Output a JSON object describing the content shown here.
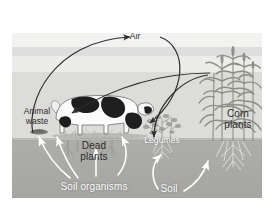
{
  "diagram": {
    "type": "cycle-illustration",
    "background_color": "#ffffff",
    "sky_color": "#ececea",
    "field_color": "#dcdcd8",
    "soil_color": "#a9a9a6",
    "arrow_dark_color": "#2e2e2e",
    "arrow_light_color": "#ffffff"
  },
  "labels": {
    "air": "Air",
    "animal_waste": "Animal\nwaste",
    "dead_plants": "Dead\nplants",
    "soil_organisms": "Soil organisms",
    "legumes": "Legumes",
    "soil": "Soil",
    "corn_plants": "Corn\nplants"
  },
  "objects": {
    "cow": "dairy-cow",
    "legume_plant": "legume-bush",
    "corn": "corn-stalks",
    "dead_plant_stubble": "dead-plant-stubble",
    "legume_roots": "legume-roots",
    "corn_roots": "corn-roots"
  },
  "flows": [
    {
      "from": "animal-waste",
      "to": "air",
      "color": "#2e2e2e"
    },
    {
      "from": "air",
      "to": "dead-plants",
      "color": "#2e2e2e"
    },
    {
      "from": "corn-plants",
      "to": "air",
      "color": "#2e2e2e"
    },
    {
      "from": "corn-plants",
      "to": "legumes",
      "color": "#2e2e2e"
    },
    {
      "from": "soil-organisms",
      "to": "animal-waste",
      "color": "#ffffff"
    },
    {
      "from": "soil-organisms",
      "to": "dead-plants",
      "color": "#ffffff"
    },
    {
      "from": "legumes",
      "to": "soil",
      "color": "#ffffff"
    },
    {
      "from": "soil",
      "to": "corn-roots",
      "color": "#ffffff"
    }
  ]
}
